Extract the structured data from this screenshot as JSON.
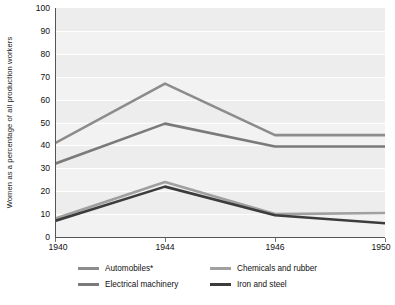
{
  "chart_data": {
    "type": "line",
    "title": "",
    "xlabel": "",
    "ylabel": "Women as a percentage of all production workers",
    "x": [
      "1940",
      "1944",
      "1946",
      "1950"
    ],
    "xtick_labels": [
      "1940",
      "1944",
      "1946",
      "1950"
    ],
    "ytick_labels": [
      "0",
      "10",
      "20",
      "30",
      "40",
      "50",
      "60",
      "70",
      "80",
      "90",
      "100"
    ],
    "ylim": [
      0,
      100
    ],
    "ytick_step": 10,
    "grid": true,
    "legend_position": "bottom",
    "series": [
      {
        "name": "Automobiles*",
        "color": "#8c8c8c",
        "values": [
          41,
          67,
          44.5,
          44.5
        ]
      },
      {
        "name": "Electrical machinery",
        "color": "#7a7a7a",
        "values": [
          32,
          49.5,
          39.5,
          39.5
        ]
      },
      {
        "name": "Chemicals and rubber",
        "color": "#a0a0a0",
        "values": [
          8,
          24,
          10,
          10.5
        ]
      },
      {
        "name": "Iron and steel",
        "color": "#3c3c3c",
        "values": [
          7,
          22,
          9.5,
          6
        ]
      }
    ]
  },
  "colors": {
    "plot_background": "#f2f2f2",
    "band": "#ededed",
    "gridline": "#ffffff",
    "axis": "#555555",
    "text": "#111111"
  }
}
